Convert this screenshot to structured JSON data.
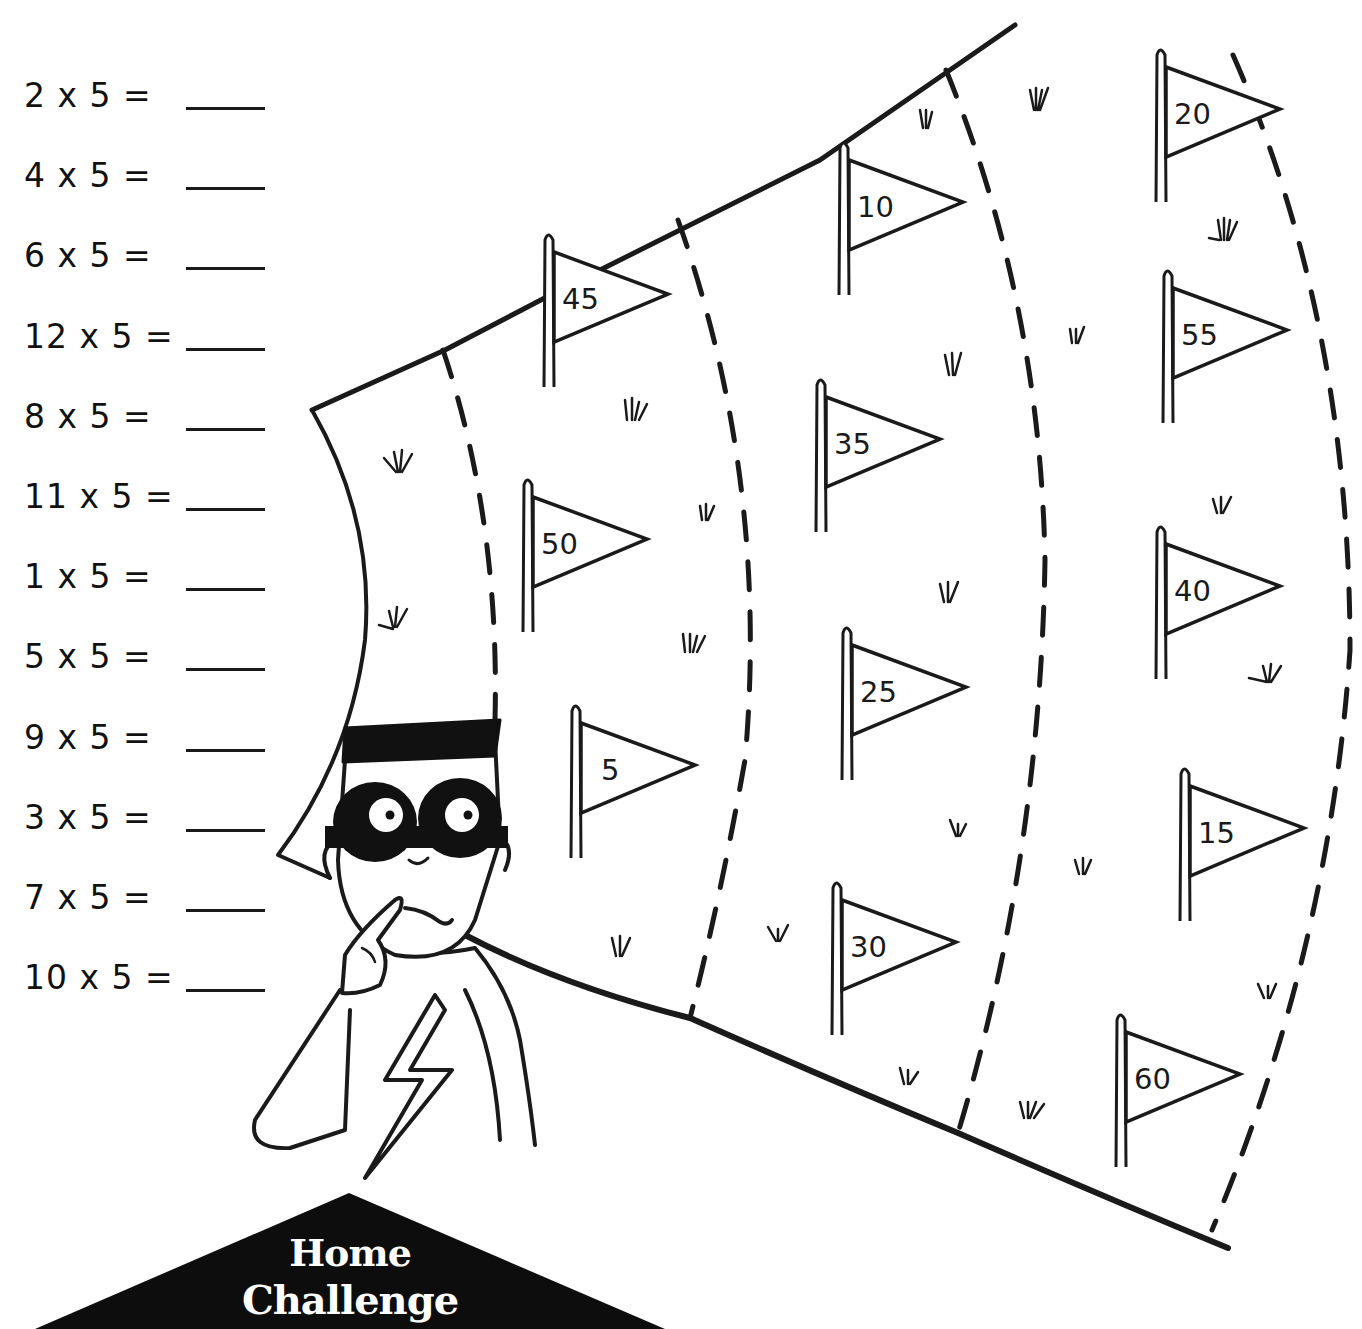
{
  "worksheet": {
    "problems": [
      {
        "text": "2 x 5 =",
        "answer": ""
      },
      {
        "text": "4 x 5 =",
        "answer": ""
      },
      {
        "text": "6 x 5 =",
        "answer": ""
      },
      {
        "text": "12 x 5 =",
        "answer": ""
      },
      {
        "text": "8 x 5 =",
        "answer": ""
      },
      {
        "text": "11 x 5 =",
        "answer": ""
      },
      {
        "text": "1 x 5 =",
        "answer": ""
      },
      {
        "text": "5 x 5 =",
        "answer": ""
      },
      {
        "text": "9 x 5 =",
        "answer": ""
      },
      {
        "text": "3 x 5 =",
        "answer": ""
      },
      {
        "text": "7 x 5 =",
        "answer": ""
      },
      {
        "text": "10 x 5 =",
        "answer": ""
      }
    ],
    "flags": [
      {
        "label": "45",
        "x": 548,
        "y": 232
      },
      {
        "label": "10",
        "x": 843,
        "y": 140
      },
      {
        "label": "20",
        "x": 1160,
        "y": 47
      },
      {
        "label": "35",
        "x": 820,
        "y": 377
      },
      {
        "label": "55",
        "x": 1167,
        "y": 268
      },
      {
        "label": "50",
        "x": 527,
        "y": 477
      },
      {
        "label": "25",
        "x": 846,
        "y": 625
      },
      {
        "label": "40",
        "x": 1160,
        "y": 524
      },
      {
        "label": "5",
        "x": 575,
        "y": 703
      },
      {
        "label": "15",
        "x": 1184,
        "y": 766
      },
      {
        "label": "30",
        "x": 836,
        "y": 880
      },
      {
        "label": "60",
        "x": 1120,
        "y": 1012
      }
    ],
    "banner": {
      "line1": "Home",
      "line2": "Challenge"
    },
    "colors": {
      "ink": "#1a1a1a",
      "background": "#ffffff",
      "banner": "#0d0d0d"
    },
    "character": {
      "description": "masked superhero with lightning-bolt chest emblem, finger on chin"
    }
  }
}
